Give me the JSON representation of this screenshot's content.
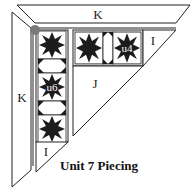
{
  "diagram": {
    "title": "Unit 7 Piecing",
    "labels": {
      "top_band": "K",
      "left_band": "K",
      "right_triangle": "I",
      "bottom_triangle": "I",
      "center_triangle": "J",
      "horizontal_unit": "u4",
      "vertical_unit": "u6"
    },
    "colors": {
      "line": "#222222",
      "star": "#1c1c1c",
      "dot": "#7a7a7a",
      "background": "#ffffff"
    }
  }
}
